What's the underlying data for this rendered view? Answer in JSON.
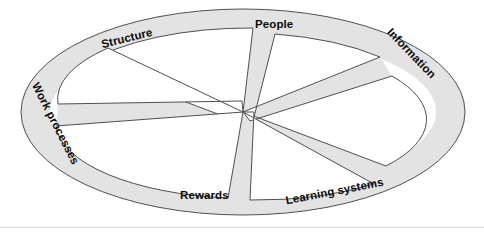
{
  "diagram": {
    "type": "wheel-spoke-diagram",
    "shape": "ellipse-with-six-spokes",
    "center": {
      "x": 243,
      "y": 112
    },
    "outer_ellipse": {
      "cx": 243,
      "cy": 112,
      "rx": 222,
      "ry": 103
    },
    "inner_ellipse": {
      "cx": 243,
      "cy": 112,
      "rx": 193,
      "ry": 76
    },
    "colors": {
      "fill": "#e3e3e3",
      "stroke": "#555555",
      "wedge_fill": "#ffffff",
      "text": "#0b0b0b",
      "background": "#ffffff",
      "baseline_rule": "#dcdcdc"
    },
    "spoke_count": 6,
    "spoke_half_width_deg": 5.0,
    "spokes": [
      {
        "id": "structure",
        "label": "Structure",
        "angle_deg": 208
      },
      {
        "id": "people",
        "label": "People",
        "angle_deg": 268
      },
      {
        "id": "information",
        "label": "Information",
        "angle_deg": 325
      },
      {
        "id": "work-processes",
        "label": "Work processes",
        "angle_deg": 160
      },
      {
        "id": "rewards",
        "label": "Rewards",
        "angle_deg": 88
      },
      {
        "id": "learning-systems",
        "label": "Learning systems",
        "angle_deg": 35
      }
    ],
    "labels": {
      "structure": "Structure",
      "people": "People",
      "information": "Information",
      "work_processes": "Work processes",
      "rewards": "Rewards",
      "learning_systems": "Learning systems"
    }
  }
}
